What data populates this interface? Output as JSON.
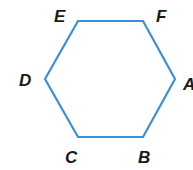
{
  "figure": {
    "shape": "hexagon",
    "stroke_color": "#3a8fd9",
    "vertices": [
      {
        "label": "A",
        "x": 175,
        "y": 79
      },
      {
        "label": "B",
        "x": 143,
        "y": 137
      },
      {
        "label": "C",
        "x": 78,
        "y": 137
      },
      {
        "label": "D",
        "x": 45,
        "y": 79
      },
      {
        "label": "E",
        "x": 78,
        "y": 21
      },
      {
        "label": "F",
        "x": 143,
        "y": 21
      }
    ],
    "labels": {
      "A": "A",
      "B": "B",
      "C": "C",
      "D": "D",
      "E": "E",
      "F": "F"
    }
  }
}
